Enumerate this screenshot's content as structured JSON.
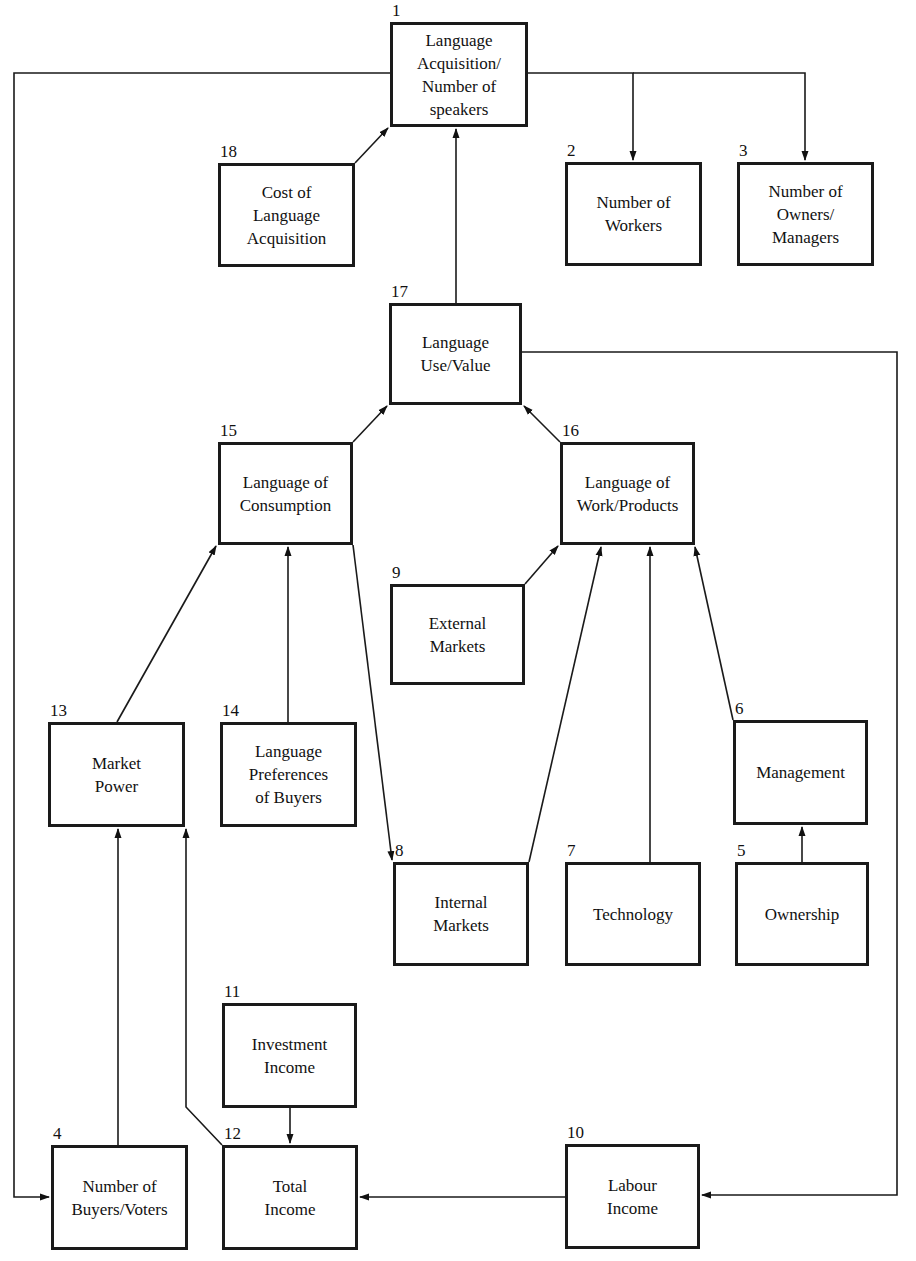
{
  "diagram": {
    "nodes": [
      {
        "id": 1,
        "number": "1",
        "label": "Language\nAcquisition/\nNumber of\nspeakers",
        "x": 390,
        "y": 22,
        "w": 138,
        "h": 105
      },
      {
        "id": 2,
        "number": "2",
        "label": "Number of\nWorkers",
        "x": 565,
        "y": 162,
        "w": 137,
        "h": 104
      },
      {
        "id": 3,
        "number": "3",
        "label": "Number of\nOwners/\nManagers",
        "x": 737,
        "y": 162,
        "w": 137,
        "h": 104
      },
      {
        "id": 4,
        "number": "4",
        "label": "Number of\nBuyers/Voters",
        "x": 51,
        "y": 1145,
        "w": 137,
        "h": 105
      },
      {
        "id": 5,
        "number": "5",
        "label": "Ownership",
        "x": 735,
        "y": 862,
        "w": 134,
        "h": 104
      },
      {
        "id": 6,
        "number": "6",
        "label": "Management",
        "x": 733,
        "y": 720,
        "w": 135,
        "h": 105
      },
      {
        "id": 7,
        "number": "7",
        "label": "Technology",
        "x": 565,
        "y": 862,
        "w": 136,
        "h": 104
      },
      {
        "id": 8,
        "number": "8",
        "label": "Internal\nMarkets",
        "x": 393,
        "y": 862,
        "w": 136,
        "h": 104
      },
      {
        "id": 9,
        "number": "9",
        "label": "External\nMarkets",
        "x": 390,
        "y": 584,
        "w": 135,
        "h": 101
      },
      {
        "id": 10,
        "number": "10",
        "label": "Labour\nIncome",
        "x": 565,
        "y": 1144,
        "w": 135,
        "h": 105
      },
      {
        "id": 11,
        "number": "11",
        "label": "Investment\nIncome",
        "x": 222,
        "y": 1003,
        "w": 135,
        "h": 105
      },
      {
        "id": 12,
        "number": "12",
        "label": "Total\nIncome",
        "x": 222,
        "y": 1145,
        "w": 136,
        "h": 105
      },
      {
        "id": 13,
        "number": "13",
        "label": "Market\nPower",
        "x": 48,
        "y": 722,
        "w": 137,
        "h": 105
      },
      {
        "id": 14,
        "number": "14",
        "label": "Language\nPreferences\nof Buyers",
        "x": 220,
        "y": 722,
        "w": 137,
        "h": 105
      },
      {
        "id": 15,
        "number": "15",
        "label": "Language of\nConsumption",
        "x": 218,
        "y": 442,
        "w": 135,
        "h": 103
      },
      {
        "id": 16,
        "number": "16",
        "label": "Language of\nWork/Products",
        "x": 560,
        "y": 442,
        "w": 135,
        "h": 103
      },
      {
        "id": 17,
        "number": "17",
        "label": "Language\nUse/Value",
        "x": 389,
        "y": 303,
        "w": 133,
        "h": 102
      },
      {
        "id": 18,
        "number": "18",
        "label": "Cost of\nLanguage\nAcquisition",
        "x": 218,
        "y": 163,
        "w": 137,
        "h": 104
      }
    ],
    "edges": [
      {
        "from": 18,
        "to": 1,
        "points": [
          [
            355,
            163
          ],
          [
            388,
            128
          ]
        ]
      },
      {
        "from": 17,
        "to": 1,
        "points": [
          [
            456,
            303
          ],
          [
            456,
            129
          ]
        ]
      },
      {
        "from": 1,
        "to": 2,
        "points": [
          [
            528,
            73
          ],
          [
            633,
            73
          ],
          [
            633,
            160
          ]
        ]
      },
      {
        "from": 1,
        "to": 3,
        "points": [
          [
            633,
            73
          ],
          [
            805,
            73
          ],
          [
            805,
            160
          ]
        ]
      },
      {
        "from": 1,
        "to": 4,
        "points": [
          [
            390,
            73
          ],
          [
            14,
            73
          ],
          [
            14,
            1197
          ],
          [
            49,
            1197
          ]
        ]
      },
      {
        "from": 15,
        "to": 17,
        "points": [
          [
            353,
            442
          ],
          [
            387,
            406
          ]
        ]
      },
      {
        "from": 16,
        "to": 17,
        "points": [
          [
            560,
            442
          ],
          [
            524,
            406
          ]
        ]
      },
      {
        "from": 17,
        "to": 10,
        "points": [
          [
            522,
            352
          ],
          [
            897,
            352
          ],
          [
            897,
            1195
          ],
          [
            702,
            1195
          ]
        ]
      },
      {
        "from": 9,
        "to": 16,
        "points": [
          [
            525,
            584
          ],
          [
            558,
            546
          ]
        ]
      },
      {
        "from": 8,
        "to": 16,
        "points": [
          [
            529,
            862
          ],
          [
            601,
            547
          ]
        ]
      },
      {
        "from": 7,
        "to": 16,
        "points": [
          [
            650,
            862
          ],
          [
            650,
            547
          ]
        ]
      },
      {
        "from": 6,
        "to": 16,
        "points": [
          [
            733,
            720
          ],
          [
            695,
            547
          ]
        ]
      },
      {
        "from": 13,
        "to": 15,
        "points": [
          [
            117,
            722
          ],
          [
            216,
            546
          ]
        ]
      },
      {
        "from": 14,
        "to": 15,
        "points": [
          [
            288,
            722
          ],
          [
            288,
            547
          ]
        ]
      },
      {
        "from": 15,
        "to": 8,
        "points": [
          [
            353,
            545
          ],
          [
            392,
            860
          ]
        ]
      },
      {
        "from": 5,
        "to": 6,
        "points": [
          [
            802,
            862
          ],
          [
            802,
            827
          ]
        ]
      },
      {
        "from": 4,
        "to": 13,
        "points": [
          [
            118,
            1145
          ],
          [
            118,
            829
          ]
        ]
      },
      {
        "from": 12,
        "to": 13,
        "points": [
          [
            222,
            1145
          ],
          [
            186,
            1107
          ],
          [
            186,
            829
          ]
        ]
      },
      {
        "from": 11,
        "to": 12,
        "points": [
          [
            290,
            1108
          ],
          [
            290,
            1143
          ]
        ]
      },
      {
        "from": 10,
        "to": 12,
        "points": [
          [
            565,
            1197
          ],
          [
            360,
            1197
          ]
        ]
      }
    ]
  }
}
